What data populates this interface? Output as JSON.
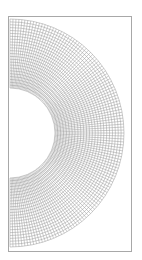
{
  "figure": {
    "type": "structured-mesh",
    "shape": "half-annulus",
    "frame": {
      "x": 8,
      "y": 16,
      "width": 123,
      "height": 235,
      "stroke": "#a8a8a8"
    },
    "mesh": {
      "center_x": 10,
      "center_y": 133,
      "inner_radius": 45,
      "outer_radius": 114,
      "radial_divisions": 24,
      "angular_divisions": 120,
      "angle_start_deg": -90,
      "angle_end_deg": 90,
      "line_color": "#9a9a9a"
    }
  }
}
